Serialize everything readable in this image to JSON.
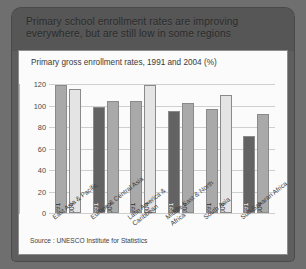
{
  "slide": {
    "header_title": "Primary school enrollment rates are improving everywhere, but are still low in some regions",
    "source": "Source : UNESCO Institute for Statistics"
  },
  "chart_data": {
    "type": "bar",
    "title": "Primary gross enrollment rates, 1991 and 2004 (%)",
    "xlabel": "",
    "ylabel": "",
    "ylim": [
      0,
      120
    ],
    "yticks": [
      0,
      20,
      40,
      60,
      80,
      100,
      120
    ],
    "grid": true,
    "legend_position": "none",
    "categories": [
      "East Asia & Pacific",
      "Europe & Central Asia",
      "Latin America & Caribbean",
      "Middle East & North Africa",
      "South Asia",
      "Sub-Saharan Africa"
    ],
    "series": [
      {
        "name": "1991",
        "values": [
          119,
          99,
          104,
          95,
          97,
          72
        ]
      },
      {
        "name": "2004",
        "values": [
          115,
          104,
          119,
          102,
          110,
          92
        ]
      }
    ],
    "bars": [
      {
        "category": "East Asia & Pacific",
        "year": "1991",
        "value": 119,
        "shade": "fill-mid"
      },
      {
        "category": "East Asia & Pacific",
        "year": "2004",
        "value": 115,
        "shade": "fill-light"
      },
      {
        "category": "Europe & Central Asia",
        "year": "1991",
        "value": 99,
        "shade": "fill-dark"
      },
      {
        "category": "Europe & Central Asia",
        "year": "2004",
        "value": 104,
        "shade": "fill-mid"
      },
      {
        "category": "Latin America & Caribbean",
        "year": "1991",
        "value": 104,
        "shade": "fill-mid"
      },
      {
        "category": "Latin America & Caribbean",
        "year": "2004",
        "value": 119,
        "shade": "fill-light"
      },
      {
        "category": "Middle East & North Africa",
        "year": "1991",
        "value": 95,
        "shade": "fill-dark"
      },
      {
        "category": "Middle East & North Africa",
        "year": "2004",
        "value": 102,
        "shade": "fill-mid"
      },
      {
        "category": "South Asia",
        "year": "1991",
        "value": 97,
        "shade": "fill-mid"
      },
      {
        "category": "South Asia",
        "year": "2004",
        "value": 110,
        "shade": "fill-light"
      },
      {
        "category": "Sub-Saharan Africa",
        "year": "1991",
        "value": 72,
        "shade": "fill-dark"
      },
      {
        "category": "Sub-Saharan Africa",
        "year": "2004",
        "value": 92,
        "shade": "fill-mid"
      }
    ],
    "colors": {
      "fill-mid": "#a9a9a9",
      "fill-light": "#e4e4e4",
      "fill-dark": "#636363",
      "gridline": "#cfcfcf",
      "panel_background": "#fbfbfb",
      "slide_background": "#5e5e5e",
      "header_background": "#565656"
    }
  }
}
